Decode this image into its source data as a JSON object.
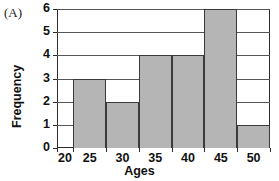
{
  "figure": {
    "panel_label": "(A)",
    "x_axis_title": "Ages",
    "y_axis_title": "Frequency",
    "bar_fill_color": "#b5b5b5",
    "bar_edge_color": "#3a3a3a",
    "frame_color": "#2b2b2b",
    "gridline_color": "#555555"
  },
  "chart_data": {
    "type": "bar",
    "title": "(A)",
    "xlabel": "Ages",
    "ylabel": "Frequency",
    "categories": [
      "20",
      "25",
      "30",
      "35",
      "40",
      "45",
      "50"
    ],
    "values": [
      0,
      3,
      2,
      4,
      4,
      6,
      1
    ],
    "bins": [
      {
        "label": "20",
        "left": 20.0,
        "right": 22.5,
        "frequency": 0
      },
      {
        "label": "25",
        "left": 22.5,
        "right": 27.5,
        "frequency": 3
      },
      {
        "label": "30",
        "left": 27.5,
        "right": 32.5,
        "frequency": 2
      },
      {
        "label": "35",
        "left": 32.5,
        "right": 37.5,
        "frequency": 4
      },
      {
        "label": "40",
        "left": 37.5,
        "right": 42.5,
        "frequency": 4
      },
      {
        "label": "45",
        "left": 42.5,
        "right": 47.5,
        "frequency": 6
      },
      {
        "label": "50",
        "left": 47.5,
        "right": 52.5,
        "frequency": 1
      }
    ],
    "xlim": [
      20,
      52.5
    ],
    "ylim": [
      0,
      6
    ],
    "xticks": [
      "20",
      "25",
      "30",
      "35",
      "40",
      "45",
      "50"
    ],
    "yticks": [
      "0",
      "1",
      "2",
      "3",
      "4",
      "5",
      "6"
    ],
    "grid": true,
    "grid_axis": "y",
    "legend": null,
    "legend_position": "none"
  }
}
